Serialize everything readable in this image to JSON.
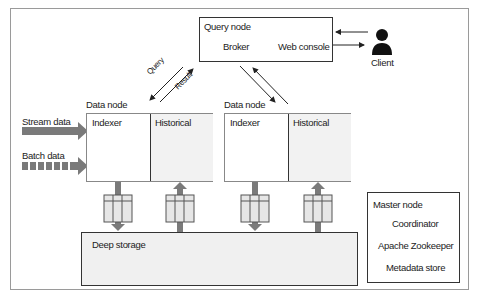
{
  "diagram": {
    "query_node": {
      "title": "Query node",
      "components": [
        "Broker",
        "Web console"
      ]
    },
    "client": {
      "label": "Client",
      "icon": "person-icon"
    },
    "query_arrows": {
      "query": "Query",
      "result": "Result"
    },
    "data_nodes": [
      {
        "title": "Data node",
        "left": "Indexer",
        "right": "Historical"
      },
      {
        "title": "Data node",
        "left": "Indexer",
        "right": "Historical"
      }
    ],
    "inputs": {
      "stream": "Stream data",
      "batch": "Batch data"
    },
    "deep_storage": {
      "title": "Deep storage"
    },
    "master_node": {
      "title": "Master node",
      "components": [
        "Coordinator",
        "Apache Zookeeper",
        "Metadata store"
      ]
    },
    "colors": {
      "border": "#333333",
      "frame": "#9a9a9a",
      "arrow_fill": "#777777",
      "segment_fill": "#e6e6e6",
      "shade": "#f0f0f0"
    }
  }
}
